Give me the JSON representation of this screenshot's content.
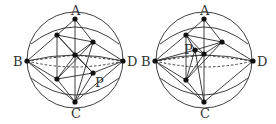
{
  "figures": [
    {
      "id": "left",
      "labels": {
        "A": "A",
        "B": "B",
        "C": "C",
        "D": "D",
        "P": "P"
      },
      "description": "Sphere with octahedron-like frame; P at lower-right inner vertex"
    },
    {
      "id": "right",
      "labels": {
        "A": "A",
        "B": "B",
        "C": "C",
        "D": "D",
        "P": "P"
      },
      "description": "Sphere with octahedron-like frame; P near center on upper-left"
    }
  ],
  "colors": {
    "line": "#2a2a2a",
    "point": "#111111",
    "label": "#333333",
    "background": "#ffffff"
  }
}
